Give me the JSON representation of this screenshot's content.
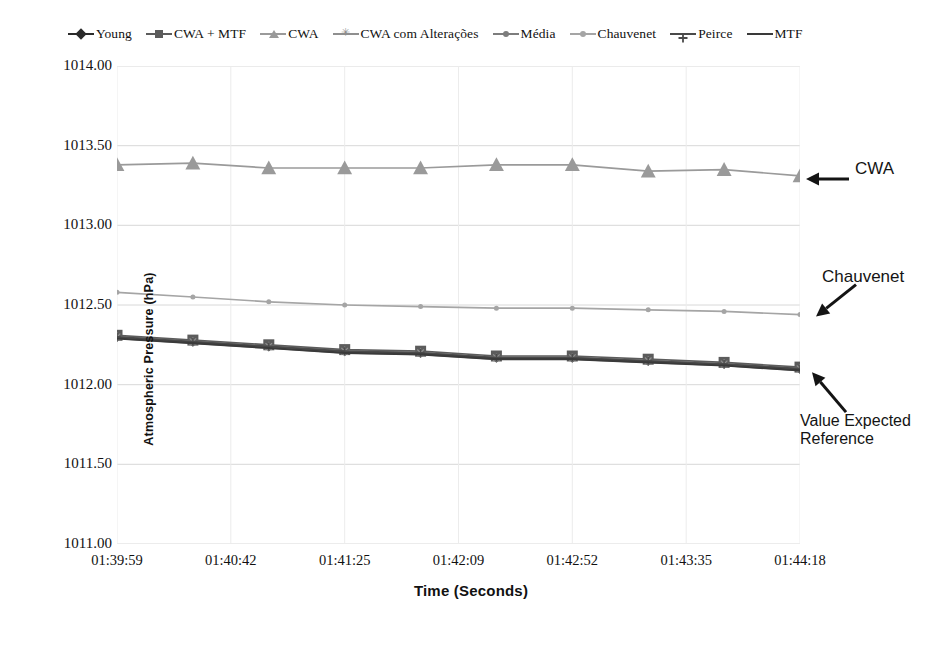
{
  "chart_data": {
    "type": "line",
    "title": "",
    "xlabel": "Time (Seconds)",
    "ylabel": "Atmospheric Pressure (hPa)",
    "ylim": [
      1011.0,
      1014.0
    ],
    "ytick_labels": [
      "1014.00",
      "1013.50",
      "1013.00",
      "1012.50",
      "1012.00",
      "1011.50",
      "1011.00"
    ],
    "ytick_values": [
      1014.0,
      1013.5,
      1013.0,
      1012.5,
      1012.0,
      1011.5,
      1011.0
    ],
    "xtick_labels": [
      "01:39:59",
      "01:40:42",
      "01:41:25",
      "01:42:09",
      "01:42:52",
      "01:43:35",
      "01:44:18"
    ],
    "grid": "horizontal",
    "legend_position": "top",
    "x": [
      0,
      1,
      2,
      3,
      4,
      5,
      6,
      7,
      8,
      9
    ],
    "series": [
      {
        "name": "Young",
        "marker": "diamond",
        "color": "#2b2b2b",
        "values": [
          1012.3,
          1012.27,
          1012.24,
          1012.21,
          1012.2,
          1012.17,
          1012.17,
          1012.15,
          1012.13,
          1012.1
        ]
      },
      {
        "name": "CWA + MTF",
        "marker": "square",
        "color": "#5c5c5c",
        "values": [
          1012.31,
          1012.28,
          1012.25,
          1012.22,
          1012.21,
          1012.18,
          1012.18,
          1012.16,
          1012.14,
          1012.11
        ]
      },
      {
        "name": "CWA",
        "marker": "triangle",
        "color": "#9a9a9a",
        "values": [
          1013.38,
          1013.39,
          1013.36,
          1013.36,
          1013.36,
          1013.38,
          1013.38,
          1013.34,
          1013.35,
          1013.31
        ]
      },
      {
        "name": "CWA com Alterações",
        "marker": "star",
        "color": "#8f8f8f",
        "values": [
          1012.3,
          1012.27,
          1012.24,
          1012.21,
          1012.2,
          1012.17,
          1012.17,
          1012.15,
          1012.13,
          1012.1
        ]
      },
      {
        "name": "Média",
        "marker": "dot",
        "color": "#7d7d7d",
        "values": [
          1012.29,
          1012.26,
          1012.23,
          1012.2,
          1012.19,
          1012.16,
          1012.16,
          1012.14,
          1012.12,
          1012.09
        ]
      },
      {
        "name": "Chauvenet",
        "marker": "dot",
        "color": "#a5a5a5",
        "values": [
          1012.58,
          1012.55,
          1012.52,
          1012.5,
          1012.49,
          1012.48,
          1012.48,
          1012.47,
          1012.46,
          1012.44
        ]
      },
      {
        "name": "Peirce",
        "marker": "plus",
        "color": "#4a4a4a",
        "values": [
          1012.3,
          1012.27,
          1012.24,
          1012.21,
          1012.2,
          1012.17,
          1012.17,
          1012.15,
          1012.13,
          1012.1
        ]
      },
      {
        "name": "MTF",
        "marker": "none",
        "color": "#3a3a3a",
        "values": [
          1012.29,
          1012.26,
          1012.23,
          1012.2,
          1012.19,
          1012.16,
          1012.16,
          1012.14,
          1012.12,
          1012.09
        ]
      }
    ],
    "annotations": [
      {
        "text": "CWA",
        "points_to_series": "CWA"
      },
      {
        "text": "Chauvenet",
        "points_to_series": "Chauvenet"
      },
      {
        "text": "Value Expected\nReference",
        "points_to_series": "CWA + MTF"
      }
    ]
  },
  "legend": {
    "items": [
      {
        "label": "Young",
        "marker": "diamond",
        "color": "#2b2b2b"
      },
      {
        "label": "CWA + MTF",
        "marker": "square",
        "color": "#5c5c5c"
      },
      {
        "label": "CWA",
        "marker": "triangle",
        "color": "#9a9a9a"
      },
      {
        "label": "CWA com Alterações",
        "marker": "star",
        "color": "#8f8f8f"
      },
      {
        "label": "Média",
        "marker": "dot",
        "color": "#7d7d7d"
      },
      {
        "label": "Chauvenet",
        "marker": "dot",
        "color": "#a5a5a5"
      },
      {
        "label": "Peirce",
        "marker": "plus",
        "color": "#4a4a4a"
      },
      {
        "label": "MTF",
        "marker": "none",
        "color": "#3a3a3a"
      }
    ]
  },
  "colors": {
    "background": "#ffffff",
    "grid": "#d8d8d8",
    "text": "#111111"
  }
}
